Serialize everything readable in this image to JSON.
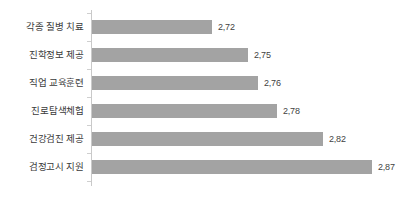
{
  "chart_data": {
    "type": "bar",
    "orientation": "horizontal",
    "title": "",
    "subtitle": "",
    "xlabel": "",
    "ylabel": "",
    "grid": false,
    "legend": false,
    "legend_position": "none",
    "decimal_separator": ",",
    "xlim": [
      2.605,
      2.9
    ],
    "bar_color": "#a3a3a3",
    "axis_color": "#c9c9c9",
    "text_color": "#3a3a3a",
    "categories": [
      "각종 질병 치료",
      "진학정보 제공",
      "직업 교육훈련",
      "진로탐색체험",
      "건강검진 제공",
      "검정고시 지원"
    ],
    "values": [
      2.72,
      2.75,
      2.76,
      2.78,
      2.82,
      2.87
    ],
    "value_labels": [
      "2,72",
      "2,75",
      "2,76",
      "2,78",
      "2,82",
      "2,87"
    ],
    "bar_pixel_widths": [
      120,
      156,
      166,
      185,
      231,
      280
    ]
  }
}
